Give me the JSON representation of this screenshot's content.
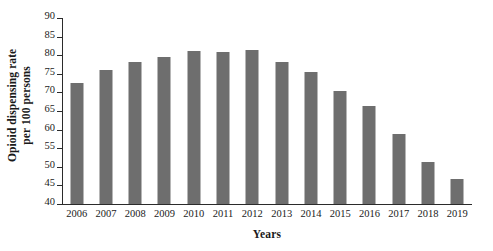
{
  "chart_data": {
    "type": "bar",
    "title": "",
    "xlabel": "Years",
    "ylabel_lines": [
      "Opioid dispensing rate",
      "per 100 persons"
    ],
    "ylabel": "Opioid dispensing rate per 100 persons",
    "categories": [
      "2006",
      "2007",
      "2008",
      "2009",
      "2010",
      "2011",
      "2012",
      "2013",
      "2014",
      "2015",
      "2016",
      "2017",
      "2018",
      "2019"
    ],
    "values": [
      72.4,
      75.9,
      78.2,
      79.5,
      81.2,
      80.9,
      81.3,
      78.1,
      75.6,
      70.4,
      66.3,
      58.7,
      51.4,
      46.7
    ],
    "ylim": [
      40,
      90
    ],
    "yticks": [
      40,
      45,
      50,
      55,
      60,
      65,
      70,
      75,
      80,
      85,
      90
    ],
    "ytick_labels": [
      "40",
      "45",
      "50",
      "55",
      "60",
      "65",
      "70",
      "75",
      "80",
      "85",
      "90"
    ],
    "grid": false,
    "legend": false,
    "bar_color": "#6e6e6e",
    "axis_color": "#2b2b2b",
    "background_color": "#ffffff"
  }
}
